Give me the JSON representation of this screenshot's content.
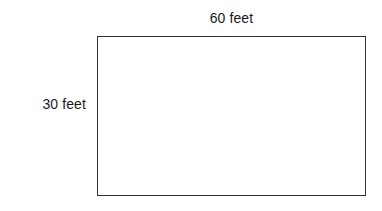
{
  "diagram": {
    "type": "rectangle-dimension-diagram",
    "shape": {
      "name": "rectangle",
      "fill_color": "#ffffff",
      "stroke_color": "#333333",
      "stroke_width_px": 1.5
    },
    "labels": {
      "width": "60 feet",
      "height": "30 feet"
    },
    "background_color": "#ffffff",
    "text_color": "#1a1a1a"
  }
}
